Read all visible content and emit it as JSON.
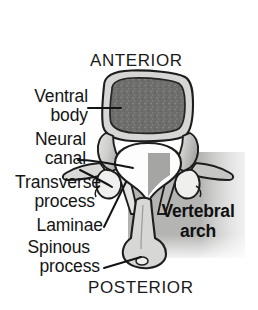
{
  "figure": {
    "orientation": {
      "anterior": "ANTERIOR",
      "posterior": "POSTERIOR"
    },
    "callouts": [
      {
        "id": "ventral-body",
        "line1": "Ventral",
        "line2": "body"
      },
      {
        "id": "neural-canal",
        "line1": "Neural",
        "line2": "canal"
      },
      {
        "id": "transverse-process",
        "line1": "Transverse",
        "line2": "process"
      },
      {
        "id": "laminae",
        "line1": "Laminae",
        "line2": ""
      },
      {
        "id": "spinous-process",
        "line1": "Spinous",
        "line2": "process"
      }
    ],
    "region": {
      "id": "vertebral-arch",
      "line1": "Vertebral",
      "line2": "arch"
    },
    "colors": {
      "background": "#ffffff",
      "ink": "#141414",
      "outline": "#1d1d1d",
      "cortical_bone": "#d0d0cf",
      "cancellous_bone": "#6d6d6c",
      "canal_fill": "#fdfdfd",
      "arch_shading": "#a9a9a8",
      "highlight_box": "#b4b4b3"
    }
  }
}
